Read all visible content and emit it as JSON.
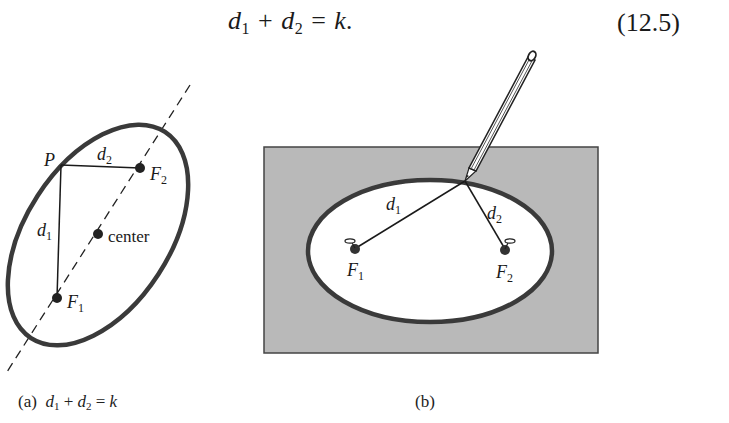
{
  "equation": {
    "d1": "d",
    "d1_sub": "1",
    "plus": "+",
    "d2": "d",
    "d2_sub": "2",
    "equals": "=",
    "rhs": "k.",
    "number": "(12.5)"
  },
  "figure_a": {
    "labels": {
      "P": "P",
      "d2": "d",
      "d2_sub": "2",
      "F2": "F",
      "F2_sub": "2",
      "d1": "d",
      "d1_sub": "1",
      "center": "center",
      "F1": "F",
      "F1_sub": "1"
    },
    "caption": {
      "prefix": "(a)",
      "d1": "d",
      "d1_sub": "1",
      "plus": "+",
      "d2": "d",
      "d2_sub": "2",
      "equals": "=",
      "rhs": "k"
    }
  },
  "figure_b": {
    "labels": {
      "d1": "d",
      "d1_sub": "1",
      "d2": "d",
      "d2_sub": "2",
      "F1": "F",
      "F1_sub": "1",
      "F2": "F",
      "F2_sub": "2"
    },
    "caption": "(b)",
    "board_color": "#b9b9b9",
    "ellipse_stroke": "#3a3a3a"
  }
}
